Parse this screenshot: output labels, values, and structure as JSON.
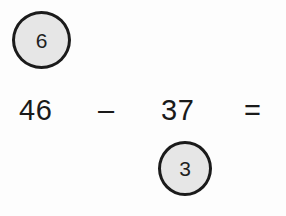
{
  "problem": {
    "type": "subtraction-with-regrouping",
    "minuend": "46",
    "operator": "–",
    "subtrahend": "37",
    "equals": "=",
    "answer_blank": "",
    "regroup_marks": [
      {
        "id": "top-left",
        "value": "6",
        "position": "above-minuend",
        "meaning": "regrouped-tens-digit"
      },
      {
        "id": "bottom-right",
        "value": "3",
        "position": "below-subtrahend",
        "meaning": "regrouped-ones-digit"
      }
    ]
  },
  "style": {
    "page_background": "#fdfdfd",
    "ink_color": "#1a1a1a",
    "circle_fill": "#e6e6e6",
    "circle_stroke": "#1b1b1b"
  }
}
